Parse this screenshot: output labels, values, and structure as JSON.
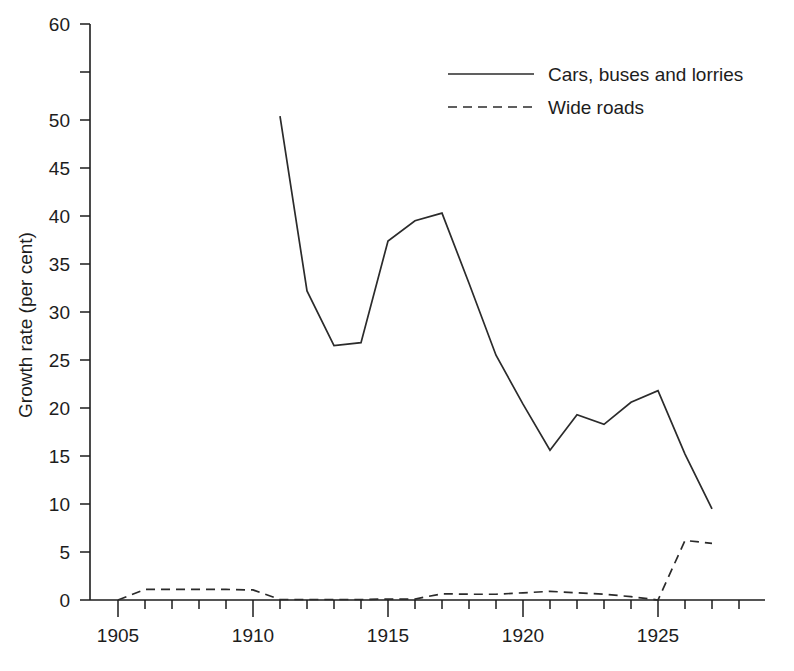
{
  "chart_data": {
    "type": "line",
    "title": "",
    "xlabel": "",
    "ylabel": "Growth rate (per cent)",
    "xlim": [
      1905,
      1929
    ],
    "ylim": [
      0,
      60
    ],
    "grid": false,
    "legend_position": "top-right",
    "x_tick_labels": [
      "1905",
      "1910",
      "1915",
      "1920",
      "1925"
    ],
    "x_major_ticks": [
      1905,
      1910,
      1915,
      1920,
      1925
    ],
    "x_minor_ticks": [
      1906,
      1907,
      1908,
      1909,
      1911,
      1912,
      1913,
      1914,
      1916,
      1917,
      1918,
      1919,
      1921,
      1922,
      1923,
      1924,
      1926,
      1927,
      1928,
      1929
    ],
    "y_tick_values": [
      0,
      5,
      10,
      15,
      20,
      25,
      30,
      35,
      40,
      45,
      50,
      55,
      60
    ],
    "y_tick_labels": [
      "0",
      "5",
      "10",
      "15",
      "20",
      "25",
      "30",
      "35",
      "40",
      "45",
      "50",
      "",
      "60"
    ],
    "series": [
      {
        "name": "Cars, buses and lorries",
        "style": "solid",
        "color": "#2b2b2b",
        "x": [
          1911,
          1912,
          1913,
          1914,
          1915,
          1916,
          1917,
          1918,
          1919,
          1920,
          1921,
          1922,
          1923,
          1924,
          1925,
          1926,
          1927
        ],
        "values": [
          50.4,
          32.2,
          26.5,
          26.8,
          37.4,
          39.5,
          40.3,
          33.0,
          25.5,
          20.4,
          15.6,
          19.3,
          18.3,
          20.6,
          21.8,
          15.2,
          9.5
        ]
      },
      {
        "name": "Wide roads",
        "style": "dashed",
        "color": "#2b2b2b",
        "x": [
          1905,
          1906,
          1907,
          1908,
          1909,
          1910,
          1911,
          1912,
          1913,
          1914,
          1915,
          1916,
          1917,
          1918,
          1919,
          1920,
          1921,
          1922,
          1923,
          1924,
          1925,
          1926,
          1927
        ],
        "values": [
          0.0,
          1.1,
          1.1,
          1.1,
          1.1,
          1.05,
          0.05,
          0.05,
          0.05,
          0.05,
          0.1,
          0.1,
          0.65,
          0.6,
          0.6,
          0.75,
          0.9,
          0.75,
          0.6,
          0.35,
          0.0,
          6.2,
          5.9
        ]
      }
    ]
  },
  "legend": {
    "entries": [
      {
        "label": "Cars, buses and lorries",
        "style": "solid"
      },
      {
        "label": "Wide roads",
        "style": "dashed"
      }
    ]
  },
  "axes": {
    "y_title": "Growth rate (per cent)"
  }
}
